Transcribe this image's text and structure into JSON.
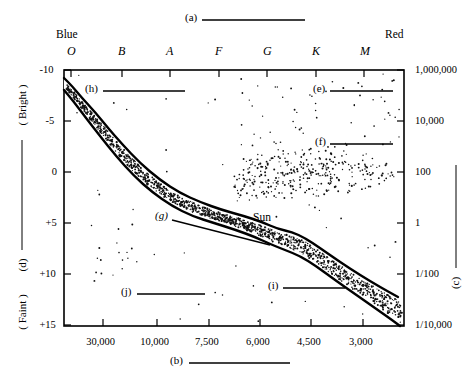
{
  "figure": {
    "title_callout": "(a)",
    "type": "Hertzsprung-Russell diagram"
  },
  "callouts": [
    {
      "id": "a",
      "label": "(a)",
      "x": 185,
      "y": 18,
      "line_x1": 202,
      "line_y1": 20,
      "line_x2": 305,
      "line_y2": 20
    },
    {
      "id": "b",
      "label": "(b)",
      "x": 170,
      "y": 361,
      "line_x1": 189,
      "line_y1": 363,
      "line_x2": 290,
      "line_y2": 363
    },
    {
      "id": "c",
      "label": "(c)",
      "x": 455,
      "y": 283,
      "line_x1": 456,
      "line_y1": 165,
      "line_x2": 456,
      "line_y2": 268,
      "vertical": true
    },
    {
      "id": "d",
      "label": "(d)",
      "x": 22,
      "y": 265,
      "line_x1": 22,
      "line_y1": 140,
      "line_x2": 22,
      "line_y2": 250,
      "vertical": true
    },
    {
      "id": "e",
      "label": "(e)",
      "x": 313,
      "y": 89,
      "line_x1": 330,
      "line_y1": 91,
      "line_x2": 393,
      "line_y2": 91
    },
    {
      "id": "f",
      "label": "(f)",
      "x": 315,
      "y": 142,
      "line_x1": 330,
      "line_y1": 144,
      "line_x2": 393,
      "line_y2": 144
    },
    {
      "id": "g",
      "label": "(g)",
      "x": 155,
      "y": 216,
      "line_x1": 172,
      "line_y1": 220,
      "line_x2": 270,
      "line_y2": 245
    },
    {
      "id": "h",
      "label": "(h)",
      "x": 85,
      "y": 89,
      "line_x1": 103,
      "line_y1": 91,
      "line_x2": 185,
      "line_y2": 91
    },
    {
      "id": "i",
      "label": "(i)",
      "x": 268,
      "y": 286,
      "line_x1": 283,
      "line_y1": 288,
      "line_x2": 345,
      "line_y2": 288
    },
    {
      "id": "j",
      "label": "(j)",
      "x": 121,
      "y": 292,
      "line_x1": 137,
      "line_y1": 294,
      "line_x2": 205,
      "line_y2": 294
    }
  ],
  "annotations": [
    {
      "name": "sun-label",
      "text": "Sun",
      "x": 253,
      "y": 218
    }
  ],
  "axes": {
    "top": {
      "left_end_label": "Blue",
      "right_end_label": "Red",
      "tick_labels": [
        "O",
        "B",
        "A",
        "F",
        "G",
        "K",
        "M"
      ],
      "tick_x": [
        71,
        122,
        170,
        219,
        267,
        316,
        364
      ]
    },
    "left": {
      "top_label": "( Bright )",
      "bottom_label": "( Faint )",
      "tick_labels": [
        "-10",
        "-5",
        "0",
        "+5",
        "+10",
        "+15"
      ],
      "tick_y": [
        70,
        121,
        172,
        223,
        274,
        325
      ]
    },
    "right": {
      "tick_labels": [
        "1,000,000",
        "10,000",
        "100",
        "1",
        "1/100",
        "1/10,000"
      ],
      "tick_y": [
        70,
        121,
        172,
        223,
        274,
        325
      ]
    },
    "bottom": {
      "tick_labels": [
        "30,000",
        "10,000",
        "7,500",
        "6,000",
        "4,500",
        "3,000"
      ],
      "tick_x": [
        103,
        157,
        209,
        260,
        311,
        363
      ]
    }
  },
  "chart_data": {
    "type": "scatter",
    "title": "",
    "xlabel": "",
    "ylabel": "",
    "x_axis_top_ticks": [
      "O",
      "B",
      "A",
      "F",
      "G",
      "K",
      "M"
    ],
    "x_axis_bottom_ticks": [
      "30,000",
      "10,000",
      "7,500",
      "6,000",
      "4,500",
      "3,000"
    ],
    "y_axis_left_ticks": [
      "-10",
      "-5",
      "0",
      "+5",
      "+10",
      "+15"
    ],
    "y_axis_right_ticks": [
      "1,000,000",
      "10,000",
      "100",
      "1",
      "1/100",
      "1/10,000"
    ],
    "grid": false,
    "legend": "none",
    "plot_box": {
      "left": 64,
      "top": 70,
      "right": 404,
      "bottom": 326
    },
    "series": [
      {
        "name": "main-sequence-band",
        "kind": "band",
        "upper_edge": [
          [
            64,
            78
          ],
          [
            72,
            86
          ],
          [
            82,
            98
          ],
          [
            95,
            112
          ],
          [
            108,
            128
          ],
          [
            122,
            144
          ],
          [
            140,
            163
          ],
          [
            160,
            180
          ],
          [
            180,
            193
          ],
          [
            200,
            202
          ],
          [
            222,
            210
          ],
          [
            244,
            216
          ],
          [
            262,
            222
          ],
          [
            278,
            229
          ],
          [
            292,
            232
          ],
          [
            305,
            238
          ],
          [
            320,
            248
          ],
          [
            340,
            262
          ],
          [
            360,
            275
          ],
          [
            380,
            287
          ],
          [
            398,
            297
          ]
        ],
        "lower_edge": [
          [
            64,
            90
          ],
          [
            74,
            102
          ],
          [
            86,
            118
          ],
          [
            100,
            136
          ],
          [
            116,
            156
          ],
          [
            134,
            176
          ],
          [
            152,
            192
          ],
          [
            172,
            206
          ],
          [
            192,
            216
          ],
          [
            214,
            223
          ],
          [
            236,
            230
          ],
          [
            255,
            237
          ],
          [
            270,
            244
          ],
          [
            285,
            250
          ],
          [
            300,
            256
          ],
          [
            316,
            266
          ],
          [
            335,
            280
          ],
          [
            355,
            294
          ],
          [
            375,
            308
          ],
          [
            392,
            320
          ],
          [
            400,
            326
          ]
        ],
        "fill": "stipple"
      },
      {
        "name": "giant-branch-cluster",
        "kind": "scatter-cloud",
        "center": [
          310,
          172
        ],
        "x_range": [
          238,
          400
        ],
        "y_range": [
          150,
          195
        ],
        "approx_count": 230
      },
      {
        "name": "supergiant-sparse",
        "kind": "scatter-sparse",
        "x_range": [
          240,
          400
        ],
        "y_range": [
          78,
          150
        ],
        "approx_count": 55
      },
      {
        "name": "white-dwarf-sparse",
        "kind": "scatter-sparse",
        "x_range": [
          92,
          160
        ],
        "y_range": [
          243,
          282
        ],
        "approx_count": 14
      },
      {
        "name": "field-sparse",
        "kind": "scatter-sparse",
        "x_range": [
          66,
          402
        ],
        "y_range": [
          74,
          322
        ],
        "approx_count": 60
      }
    ],
    "markers": [
      {
        "label": "Sun",
        "x": 253,
        "y": 218
      }
    ]
  },
  "colors": {
    "ink": "#000000",
    "paper": "#ffffff"
  }
}
